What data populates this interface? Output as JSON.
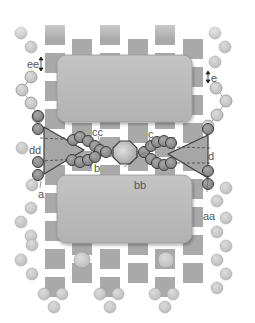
{
  "diagram": {
    "type": "schematic",
    "colors": {
      "pad": "#a9a9a9",
      "pad_light": "#cfcfcf",
      "block": "#b9b9b9",
      "block_border": "#9a9a9a",
      "bead_light": "#c8c8c8",
      "bead_dark": "#8c8c8c",
      "bead_outline": "#444444",
      "triangle_fill": "#a8a8a8",
      "octagon_fill": "#b0b0b0",
      "label": "#555555"
    },
    "labels": {
      "ee": "ee",
      "e": "e",
      "dd": "dd",
      "d": "d",
      "cc": "cc",
      "c": "c",
      "bb": "bb",
      "b": "b",
      "a": "a",
      "aa": "aa"
    },
    "components": {
      "upper_block": "upper-block",
      "lower_block": "lower-block",
      "left_triangle": "left-triangle",
      "right_triangle": "right-triangle",
      "center_octagon": "center-octagon"
    }
  }
}
